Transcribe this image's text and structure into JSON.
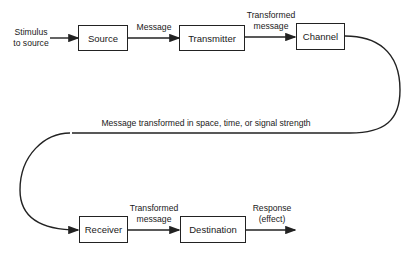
{
  "nodes": {
    "source": "Source",
    "transmitter": "Transmitter",
    "channel": "Channel",
    "receiver": "Receiver",
    "destination": "Destination"
  },
  "edges": {
    "input": {
      "line1": "Stimulus",
      "line2": "to source"
    },
    "source_to_transmitter": "Message",
    "transmitter_to_channel": {
      "line1": "Transformed",
      "line2": "message"
    },
    "channel_to_receiver": "Message transformed in space, time, or signal strength",
    "receiver_to_destination": {
      "line1": "Transformed",
      "line2": "message"
    },
    "output": {
      "line1": "Response",
      "line2": "(effect)"
    }
  }
}
